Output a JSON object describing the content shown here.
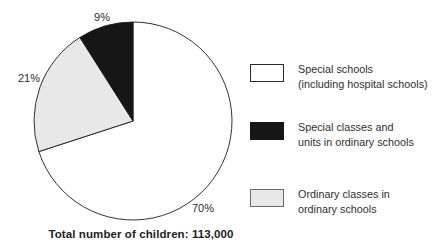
{
  "chart_data": {
    "type": "pie",
    "title": "",
    "caption": "Total number of children: 113,000",
    "total_value": "113,000",
    "start_angle_deg": 0,
    "direction": "clockwise",
    "slices": [
      {
        "name": "Special schools (including hospital schools)",
        "value": 70,
        "label": "70%",
        "color": "#ffffff"
      },
      {
        "name": "Ordinary classes in ordinary schools",
        "value": 21,
        "label": "21%",
        "color": "#e8e8e8"
      },
      {
        "name": "Special classes and units in ordinary schools",
        "value": 9,
        "label": "9%",
        "color": "#161616"
      }
    ],
    "legend_position": "right",
    "outline_color": "#1c1c1c"
  },
  "legend": {
    "items": [
      {
        "line1": "Special schools",
        "line2": "(including hospital schools)",
        "color": "#ffffff",
        "border": "#2b2b2b"
      },
      {
        "line1": "Special classes and",
        "line2": "units in ordinary schools",
        "color": "#161616",
        "border": "#161616"
      },
      {
        "line1": "Ordinary classes in",
        "line2": "ordinary schools",
        "color": "#e8e8e8",
        "border": "#6a6a6a"
      }
    ]
  }
}
